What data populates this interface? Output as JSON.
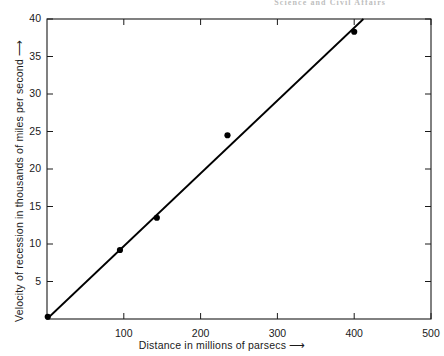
{
  "page": {
    "running_header": "Science and Civil Affairs"
  },
  "figure": {
    "x_axis_title": "Distance in millions of parsecs",
    "x_axis_arrow": "⟶",
    "y_axis_title": "Velocity of recession in thousands of miles per second",
    "y_axis_arrow": "⟶"
  },
  "chart_data": {
    "type": "scatter",
    "title": "",
    "subtitle": "",
    "xlabel": "Distance in millions of parsecs",
    "ylabel": "Velocity of recession in thousands of miles per second",
    "xlim": [
      0,
      500
    ],
    "ylim": [
      0,
      40
    ],
    "xticks": [
      100,
      200,
      300,
      400,
      500
    ],
    "xtick_labels": [
      "100",
      "200",
      "300",
      "400",
      "500"
    ],
    "yticks": [
      5,
      10,
      15,
      20,
      25,
      30,
      35,
      40
    ],
    "ytick_labels": [
      "5",
      "10",
      "15",
      "20",
      "25",
      "30",
      "35",
      "40"
    ],
    "grid": false,
    "legend": null,
    "frame": "box",
    "tick_direction": "in",
    "series": [
      {
        "name": "Observed galaxies",
        "marker": "filled-circle",
        "marker_color": "#000000",
        "points": [
          {
            "x": 1,
            "y": 0.3
          },
          {
            "x": 95,
            "y": 9.2
          },
          {
            "x": 143,
            "y": 13.5
          },
          {
            "x": 235,
            "y": 24.5
          },
          {
            "x": 400,
            "y": 38.3
          }
        ]
      },
      {
        "name": "Fitted line",
        "type": "line",
        "line_color": "#000000",
        "points": [
          {
            "x": 0,
            "y": 0
          },
          {
            "x": 412,
            "y": 40
          }
        ]
      }
    ]
  }
}
